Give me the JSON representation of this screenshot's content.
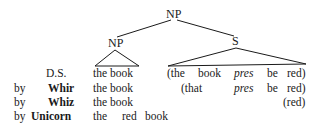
{
  "tree": {
    "root": "NP",
    "left_child": "NP",
    "right_child": "S"
  },
  "rows": [
    {
      "by": "",
      "label": "D.S.",
      "left": "the book",
      "right": [
        "(the",
        "book",
        "pres",
        "be",
        "red)"
      ]
    },
    {
      "by": "by",
      "label": "Whir",
      "left": "the book",
      "right": [
        "(that",
        "pres",
        "be",
        "red)"
      ]
    },
    {
      "by": "by",
      "label": "Whiz",
      "left": "the book",
      "right": [
        "(red)"
      ]
    },
    {
      "by": "by",
      "label": "Unicorn",
      "left": "the",
      "left2": "red",
      "left3": "book"
    }
  ]
}
